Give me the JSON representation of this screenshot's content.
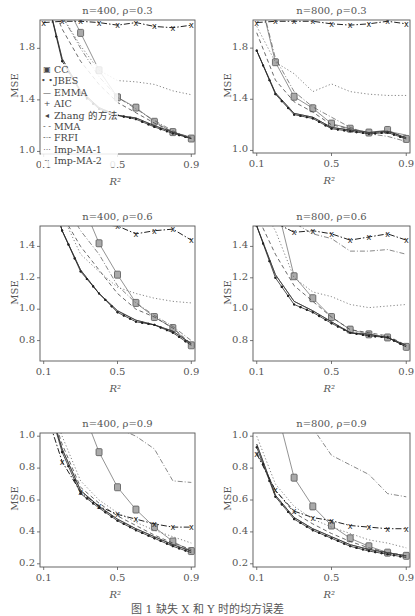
{
  "caption": "图 1  缺失 X 和 Y 时的均方误差",
  "legend": [
    {
      "name": "CC",
      "symbol": "▣"
    },
    {
      "name": "JBES",
      "symbol": "• •"
    },
    {
      "name": "EMMA",
      "symbol": "—"
    },
    {
      "name": "AIC",
      "symbol": "+"
    },
    {
      "name": "Zhang 的方法",
      "symbol": "◂"
    },
    {
      "name": "MMA",
      "symbol": "- -"
    },
    {
      "name": "FRFI",
      "symbol": "-·-"
    },
    {
      "name": "Imp-MA-1",
      "symbol": "···"
    },
    {
      "name": "Imp-MA-2",
      "symbol": "-·"
    }
  ],
  "chart_data": [
    {
      "type": "line",
      "title": "n=400, ρ=0.3",
      "xlabel": "R²",
      "ylabel": "MSE",
      "xlim": [
        0.08,
        0.92
      ],
      "ylim": [
        0.98,
        2.02
      ],
      "xticks": [
        "0.1",
        "0.5",
        "0.9"
      ],
      "yticks": [
        "1.0",
        "1.4",
        "1.8"
      ],
      "x": [
        0.1,
        0.2,
        0.3,
        0.4,
        0.5,
        0.6,
        0.7,
        0.8,
        0.9
      ],
      "series": [
        {
          "name": "CC",
          "values": [
            2.3,
            2.2,
            1.92,
            1.63,
            1.42,
            1.34,
            1.23,
            1.15,
            1.1
          ]
        },
        {
          "name": "JBES",
          "values": [
            2.3,
            1.7,
            1.45,
            1.33,
            1.28,
            1.25,
            1.19,
            1.14,
            1.1
          ]
        },
        {
          "name": "EMMA",
          "values": [
            2.3,
            1.72,
            1.47,
            1.34,
            1.28,
            1.26,
            1.2,
            1.15,
            1.1
          ]
        },
        {
          "name": "AIC",
          "values": [
            2.3,
            1.72,
            1.47,
            1.34,
            1.28,
            1.26,
            1.2,
            1.15,
            1.11
          ]
        },
        {
          "name": "Zhang 的方法",
          "values": [
            2.3,
            1.7,
            1.46,
            1.33,
            1.28,
            1.25,
            1.19,
            1.14,
            1.1
          ]
        },
        {
          "name": "MMA",
          "values": [
            2.3,
            1.95,
            1.7,
            1.52,
            1.38,
            1.3,
            1.22,
            1.15,
            1.1
          ]
        },
        {
          "name": "FRFI",
          "values": [
            2.0,
            2.01,
            2.01,
            2.0,
            1.98,
            2.0,
            1.97,
            1.96,
            1.98
          ]
        },
        {
          "name": "Imp-MA-1",
          "values": [
            2.3,
            2.05,
            1.82,
            1.63,
            1.55,
            1.54,
            1.52,
            1.47,
            1.44
          ]
        },
        {
          "name": "Imp-MA-2",
          "values": [
            2.3,
            2.05,
            1.8,
            1.58,
            1.42,
            1.33,
            1.24,
            1.16,
            1.1
          ]
        }
      ]
    },
    {
      "type": "line",
      "title": "n=800, ρ=0.3",
      "xlabel": "R²",
      "ylabel": "MSE",
      "xlim": [
        0.08,
        0.92
      ],
      "ylim": [
        0.98,
        2.02
      ],
      "xticks": [
        "0.1",
        "0.5",
        "0.9"
      ],
      "yticks": [
        "1.0",
        "1.4",
        "1.8"
      ],
      "x": [
        0.1,
        0.2,
        0.3,
        0.4,
        0.5,
        0.6,
        0.7,
        0.8,
        0.9
      ],
      "series": [
        {
          "name": "CC",
          "values": [
            2.3,
            1.69,
            1.42,
            1.33,
            1.21,
            1.17,
            1.14,
            1.16,
            1.09
          ]
        },
        {
          "name": "JBES",
          "values": [
            1.78,
            1.44,
            1.28,
            1.25,
            1.17,
            1.15,
            1.13,
            1.14,
            1.09
          ]
        },
        {
          "name": "EMMA",
          "values": [
            1.78,
            1.45,
            1.29,
            1.26,
            1.18,
            1.16,
            1.14,
            1.15,
            1.1
          ]
        },
        {
          "name": "AIC",
          "values": [
            1.78,
            1.45,
            1.29,
            1.26,
            1.18,
            1.16,
            1.14,
            1.15,
            1.12
          ]
        },
        {
          "name": "Zhang 的方法",
          "values": [
            1.78,
            1.44,
            1.28,
            1.25,
            1.17,
            1.15,
            1.13,
            1.14,
            1.09
          ]
        },
        {
          "name": "MMA",
          "values": [
            1.92,
            1.55,
            1.38,
            1.3,
            1.2,
            1.17,
            1.14,
            1.15,
            1.1
          ]
        },
        {
          "name": "FRFI",
          "values": [
            2.0,
            2.01,
            2.01,
            2.01,
            1.99,
            1.98,
            1.99,
            2.01,
            1.99
          ]
        },
        {
          "name": "Imp-MA-1",
          "values": [
            1.97,
            1.69,
            1.6,
            1.46,
            1.52,
            1.46,
            1.44,
            1.43,
            1.43
          ]
        },
        {
          "name": "Imp-MA-2",
          "values": [
            2.3,
            1.72,
            1.46,
            1.34,
            1.26,
            1.18,
            1.13,
            1.11,
            1.07
          ]
        }
      ]
    },
    {
      "type": "line",
      "title": "n=400, ρ=0.6",
      "xlabel": "R²",
      "ylabel": "MSE",
      "xlim": [
        0.08,
        0.92
      ],
      "ylim": [
        0.67,
        1.53
      ],
      "xticks": [
        "0.1",
        "0.5",
        "0.9"
      ],
      "yticks": [
        "0.8",
        "1.0",
        "1.2",
        "1.4"
      ],
      "x": [
        0.1,
        0.2,
        0.3,
        0.4,
        0.5,
        0.6,
        0.7,
        0.8,
        0.9
      ],
      "series": [
        {
          "name": "CC",
          "values": [
            2.0,
            1.9,
            1.7,
            1.42,
            1.22,
            1.04,
            0.95,
            0.88,
            0.77
          ]
        },
        {
          "name": "JBES",
          "values": [
            1.9,
            1.5,
            1.24,
            1.1,
            0.98,
            0.92,
            0.9,
            0.85,
            0.77
          ]
        },
        {
          "name": "EMMA",
          "values": [
            1.9,
            1.5,
            1.25,
            1.1,
            0.99,
            0.93,
            0.9,
            0.86,
            0.78
          ]
        },
        {
          "name": "AIC",
          "values": [
            1.9,
            1.5,
            1.25,
            1.1,
            0.99,
            0.93,
            0.9,
            0.86,
            0.78
          ]
        },
        {
          "name": "Zhang 的方法",
          "values": [
            1.9,
            1.5,
            1.24,
            1.1,
            0.98,
            0.92,
            0.9,
            0.85,
            0.77
          ]
        },
        {
          "name": "MMA",
          "values": [
            1.9,
            1.6,
            1.4,
            1.25,
            1.1,
            1.0,
            0.95,
            0.88,
            0.78
          ]
        },
        {
          "name": "FRFI",
          "values": [
            1.6,
            1.56,
            1.55,
            1.54,
            1.53,
            1.48,
            1.5,
            1.51,
            1.44
          ]
        },
        {
          "name": "Imp-MA-1",
          "values": [
            1.9,
            1.6,
            1.35,
            1.24,
            1.14,
            1.1,
            1.07,
            1.05,
            1.04
          ]
        },
        {
          "name": "Imp-MA-2",
          "values": [
            2.0,
            1.7,
            1.5,
            1.35,
            1.15,
            1.04,
            0.96,
            0.89,
            0.8
          ]
        }
      ]
    },
    {
      "type": "line",
      "title": "n=800, ρ=0.6",
      "xlabel": "R²",
      "ylabel": "MSE",
      "xlim": [
        0.08,
        0.92
      ],
      "ylim": [
        0.67,
        1.53
      ],
      "xticks": [
        "0.1",
        "0.5",
        "0.9"
      ],
      "yticks": [
        "0.8",
        "1.0",
        "1.2",
        "1.4"
      ],
      "x": [
        0.1,
        0.2,
        0.3,
        0.4,
        0.5,
        0.6,
        0.7,
        0.8,
        0.9
      ],
      "series": [
        {
          "name": "CC",
          "values": [
            1.9,
            1.7,
            1.21,
            1.07,
            0.95,
            0.87,
            0.84,
            0.82,
            0.76
          ]
        },
        {
          "name": "JBES",
          "values": [
            1.53,
            1.2,
            1.03,
            0.98,
            0.91,
            0.85,
            0.83,
            0.82,
            0.76
          ]
        },
        {
          "name": "EMMA",
          "values": [
            1.53,
            1.22,
            1.05,
            0.99,
            0.92,
            0.85,
            0.84,
            0.82,
            0.77
          ]
        },
        {
          "name": "AIC",
          "values": [
            1.53,
            1.22,
            1.05,
            0.99,
            0.92,
            0.85,
            0.84,
            0.82,
            0.77
          ]
        },
        {
          "name": "Zhang 的方法",
          "values": [
            1.53,
            1.2,
            1.03,
            0.98,
            0.91,
            0.85,
            0.83,
            0.82,
            0.76
          ]
        },
        {
          "name": "MMA",
          "values": [
            1.6,
            1.35,
            1.15,
            1.05,
            0.95,
            0.87,
            0.85,
            0.83,
            0.77
          ]
        },
        {
          "name": "FRFI",
          "values": [
            1.6,
            1.55,
            1.49,
            1.5,
            1.48,
            1.44,
            1.46,
            1.48,
            1.44
          ]
        },
        {
          "name": "Imp-MA-1",
          "values": [
            1.7,
            1.5,
            1.2,
            1.11,
            1.08,
            1.03,
            1.01,
            1.02,
            1.03
          ]
        },
        {
          "name": "Imp-MA-2",
          "values": [
            1.8,
            1.6,
            1.55,
            1.48,
            1.45,
            1.37,
            1.37,
            1.38,
            1.35
          ]
        }
      ]
    },
    {
      "type": "line",
      "title": "n=400, ρ=0.9",
      "xlabel": "R²",
      "ylabel": "MSE",
      "xlim": [
        0.08,
        0.92
      ],
      "ylim": [
        0.18,
        1.02
      ],
      "xticks": [
        "0.1",
        "0.5",
        "0.9"
      ],
      "yticks": [
        "0.2",
        "0.4",
        "0.6",
        "0.8",
        "1.0"
      ],
      "x": [
        0.1,
        0.2,
        0.3,
        0.4,
        0.5,
        0.6,
        0.7,
        0.8,
        0.9
      ],
      "series": [
        {
          "name": "CC",
          "values": [
            1.5,
            1.4,
            1.2,
            0.9,
            0.68,
            0.54,
            0.43,
            0.34,
            0.28
          ]
        },
        {
          "name": "JBES",
          "values": [
            1.3,
            0.9,
            0.64,
            0.55,
            0.47,
            0.41,
            0.36,
            0.31,
            0.27
          ]
        },
        {
          "name": "EMMA",
          "values": [
            1.3,
            0.92,
            0.66,
            0.56,
            0.48,
            0.42,
            0.37,
            0.32,
            0.28
          ]
        },
        {
          "name": "AIC",
          "values": [
            1.3,
            0.92,
            0.66,
            0.56,
            0.48,
            0.42,
            0.37,
            0.32,
            0.28
          ]
        },
        {
          "name": "Zhang 的方法",
          "values": [
            1.3,
            0.9,
            0.64,
            0.55,
            0.47,
            0.41,
            0.36,
            0.31,
            0.27
          ]
        },
        {
          "name": "MMA",
          "values": [
            1.3,
            0.95,
            0.68,
            0.58,
            0.5,
            0.44,
            0.38,
            0.33,
            0.29
          ]
        },
        {
          "name": "FRFI",
          "values": [
            1.2,
            0.84,
            0.65,
            0.56,
            0.51,
            0.48,
            0.45,
            0.43,
            0.43
          ]
        },
        {
          "name": "Imp-MA-1",
          "values": [
            1.3,
            1.0,
            0.72,
            0.6,
            0.52,
            0.46,
            0.41,
            0.37,
            0.33
          ]
        },
        {
          "name": "Imp-MA-2",
          "values": [
            1.5,
            1.4,
            1.2,
            1.1,
            1.05,
            1.0,
            0.92,
            0.72,
            0.71
          ]
        }
      ]
    },
    {
      "type": "line",
      "title": "n=800, ρ=0.9",
      "xlabel": "R²",
      "ylabel": "MSE",
      "xlim": [
        0.08,
        0.92
      ],
      "ylim": [
        0.18,
        1.02
      ],
      "xticks": [
        "0.1",
        "0.5",
        "0.9"
      ],
      "yticks": [
        "0.2",
        "0.4",
        "0.6",
        "0.8",
        "1.0"
      ],
      "x": [
        0.1,
        0.2,
        0.3,
        0.4,
        0.5,
        0.6,
        0.7,
        0.8,
        0.9
      ],
      "series": [
        {
          "name": "CC",
          "values": [
            1.5,
            1.2,
            0.74,
            0.56,
            0.44,
            0.36,
            0.31,
            0.27,
            0.25
          ]
        },
        {
          "name": "JBES",
          "values": [
            0.93,
            0.62,
            0.48,
            0.41,
            0.36,
            0.31,
            0.28,
            0.26,
            0.24
          ]
        },
        {
          "name": "EMMA",
          "values": [
            0.95,
            0.63,
            0.49,
            0.42,
            0.37,
            0.32,
            0.29,
            0.27,
            0.25
          ]
        },
        {
          "name": "AIC",
          "values": [
            0.95,
            0.63,
            0.49,
            0.42,
            0.37,
            0.32,
            0.29,
            0.27,
            0.25
          ]
        },
        {
          "name": "Zhang 的方法",
          "values": [
            0.93,
            0.62,
            0.48,
            0.41,
            0.36,
            0.31,
            0.28,
            0.26,
            0.24
          ]
        },
        {
          "name": "MMA",
          "values": [
            0.9,
            0.66,
            0.52,
            0.45,
            0.39,
            0.34,
            0.3,
            0.27,
            0.25
          ]
        },
        {
          "name": "FRFI",
          "values": [
            0.89,
            0.66,
            0.53,
            0.49,
            0.47,
            0.44,
            0.43,
            0.42,
            0.42
          ]
        },
        {
          "name": "Imp-MA-1",
          "values": [
            1.0,
            0.7,
            0.56,
            0.48,
            0.43,
            0.39,
            0.35,
            0.33,
            0.3
          ]
        },
        {
          "name": "Imp-MA-2",
          "values": [
            1.5,
            1.3,
            1.15,
            1.05,
            0.88,
            0.82,
            0.76,
            0.64,
            0.62
          ]
        }
      ]
    }
  ]
}
